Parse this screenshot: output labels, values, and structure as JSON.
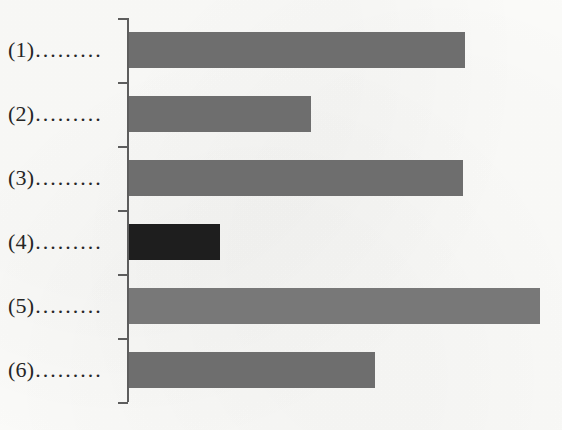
{
  "chart_data": {
    "type": "bar",
    "orientation": "horizontal",
    "title": "",
    "subtitle": "",
    "xlabel": "",
    "ylabel": "",
    "legend": [],
    "legend_position": "none",
    "grid": false,
    "axis_tick_labels": [],
    "value_labels_shown": false,
    "xlim": [
      0,
      100
    ],
    "categories": [
      "(1)",
      "(2)",
      "(3)",
      "(4)",
      "(5)",
      "(6)"
    ],
    "category_leader": ".........",
    "values": [
      81.7,
      44.2,
      81.2,
      22.1,
      100.0,
      59.9
    ],
    "bar_pixel_lengths": [
      336,
      182,
      334,
      91,
      411,
      246
    ],
    "bar_colors": [
      "#6e6e6e",
      "#6e6e6e",
      "#6e6e6e",
      "#1e1e1e",
      "#787878",
      "#6e6e6e"
    ],
    "highlighted_category": "(4)",
    "axis_color": "#5d5d5d",
    "background_color": "#fcfcfa",
    "text_color": "#262626"
  },
  "axis": {
    "tick_count": 7,
    "tick_positions_px": [
      18,
      82,
      146,
      210,
      274,
      338,
      402
    ]
  }
}
